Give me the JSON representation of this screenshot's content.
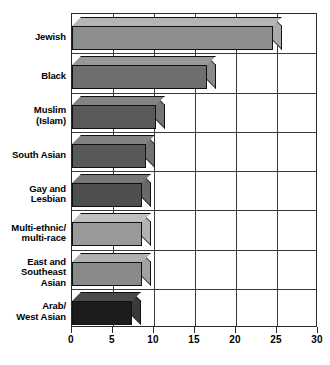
{
  "chart_data": {
    "type": "bar",
    "orientation": "horizontal",
    "title": "",
    "xlabel": "",
    "ylabel": "",
    "xlim": [
      0,
      30
    ],
    "xticks": [
      0,
      5,
      10,
      15,
      20,
      25,
      30
    ],
    "xtick_labels": [
      "0",
      "5",
      "10",
      "15",
      "20",
      "25",
      "30"
    ],
    "grid": true,
    "grid_axis": "both",
    "legend": false,
    "style": "3d-isometric-bar",
    "categories": [
      "Jewish",
      "Black",
      "Muslim\n(Islam)",
      "South Asian",
      "Gay and\nLesbian",
      "Multi-ethnic/\nmulti-race",
      "East and\nSoutheast\nAsian",
      "Arab/\nWest Asian"
    ],
    "values": [
      24.5,
      16.5,
      10.2,
      9.0,
      8.5,
      8.5,
      8.5,
      7.3
    ],
    "bar_colors": [
      "#8e8e8e",
      "#6f6f6f",
      "#5a5a5a",
      "#595959",
      "#4e4e4e",
      "#9a9a9a",
      "#8a8a8a",
      "#1c1c1c"
    ],
    "bar_top_colors": [
      "#b5b5b5",
      "#989898",
      "#848484",
      "#828282",
      "#777777",
      "#c0c0c0",
      "#b0b0b0",
      "#4a4a4a"
    ],
    "bar_side_colors": [
      "#aaaaaa",
      "#8b8b8b",
      "#757575",
      "#737373",
      "#696969",
      "#b2b2b2",
      "#a2a2a2",
      "#3a3a3a"
    ]
  },
  "axis": {
    "x_tick_labels": [
      "0",
      "5",
      "10",
      "15",
      "20",
      "25",
      "30"
    ],
    "y_category_labels": [
      "Jewish",
      "Black",
      "Muslim\n(Islam)",
      "South Asian",
      "Gay and\nLesbian",
      "Multi-ethnic/\nmulti-race",
      "East and\nSoutheast\nAsian",
      "Arab/\nWest Asian"
    ]
  },
  "colors": {
    "frame": "#2a2a2a",
    "grid": "#3a3a3a",
    "background": "#ffffff",
    "text": "#000000"
  }
}
